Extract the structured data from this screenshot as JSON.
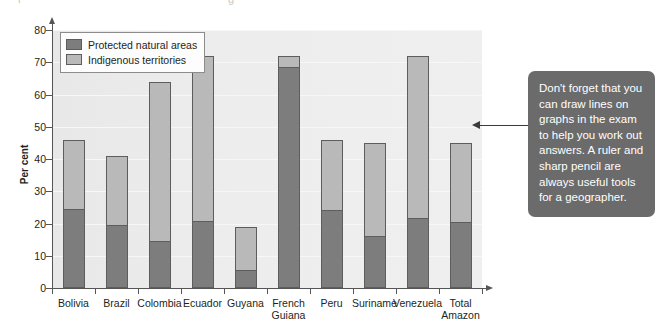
{
  "top_cropped_text": {
    "left_fragment": "r",
    "right_fragment": "g"
  },
  "chart_data": {
    "type": "bar",
    "subtype": "stacked-vertical",
    "title": "",
    "xlabel": "",
    "ylabel": "Per cent",
    "ylim": [
      0,
      80
    ],
    "ytick_step": 10,
    "ytick_labels": [
      "0",
      "10",
      "20",
      "30",
      "40",
      "50",
      "60",
      "70",
      "80"
    ],
    "grid": true,
    "legend_position": "top-left-inside",
    "categories": [
      "Bolivia",
      "Brazil",
      "Colombia",
      "Ecuador",
      "Guyana",
      "French Guiana",
      "Peru",
      "Suriname",
      "Venezuela",
      "Total Amazon"
    ],
    "series": [
      {
        "name": "Protected natural areas",
        "color": "#7d7d7d",
        "values": [
          24,
          19,
          14,
          20,
          5,
          68,
          23.5,
          15.5,
          21,
          20
        ]
      },
      {
        "name": "Indigenous territories",
        "color": "#b9b9b9",
        "values": [
          22,
          22,
          50,
          52,
          14,
          4,
          22.5,
          29.5,
          51,
          25
        ]
      }
    ],
    "totals": [
      46,
      41,
      64,
      72,
      19,
      72,
      46,
      45,
      72,
      45
    ]
  },
  "legend": {
    "items": [
      {
        "label": "Protected natural areas",
        "swatch": "dark"
      },
      {
        "label": "Indigenous territories",
        "swatch": "light"
      }
    ]
  },
  "callout": {
    "text": "Don't forget that you can draw lines on graphs in the exam to help you work out answers. A ruler and sharp pencil are always useful tools for a geographer.",
    "background_color": "#6b6b6b",
    "text_color": "#ffffff",
    "arrow_color": "#3b3b3b",
    "arrow_direction": "left"
  }
}
